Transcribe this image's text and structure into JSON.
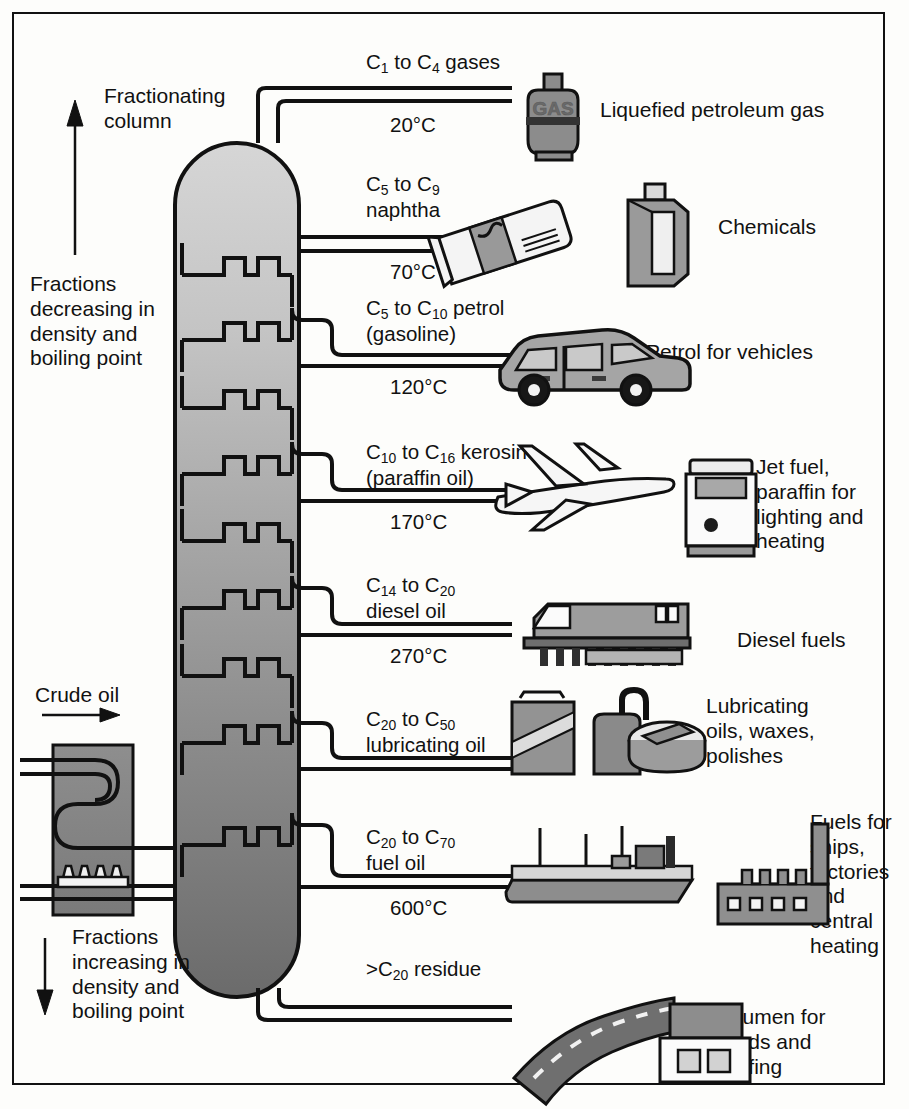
{
  "diagram": {
    "column_label": "Fractionating\ncolumn",
    "top_arrow_note": "Fractions\ndecreasing in\ndensity and\nboiling point",
    "bottom_arrow_note": "Fractions\nincreasing in\ndensity and\nboiling point",
    "feed_label": "Crude oil",
    "colors": {
      "ink": "#111111",
      "column_top": "#d2d2d2",
      "column_bottom": "#6f6f6f",
      "icon_fill": "#8c8c8c",
      "icon_light": "#c9c9c9",
      "background": "#fdfdfb"
    }
  },
  "fractions": [
    {
      "id": "gases",
      "range_html": "C<sub>1</sub> to C<sub>4</sub> gases",
      "range_text": "C1 to C4 gases",
      "temperature": "20°C",
      "use": "Liquefied petroleum gas",
      "icon": "gas-cylinder-icon"
    },
    {
      "id": "naphtha",
      "range_html": "C<sub>5</sub> to C<sub>9</sub>\nnaphtha",
      "range_text": "C5 to C9 naphtha",
      "temperature": "70°C",
      "use": "Chemicals",
      "icon": "chemicals-icon"
    },
    {
      "id": "petrol",
      "range_html": "C<sub>5</sub> to C<sub>10</sub> petrol\n(gasoline)",
      "range_text": "C5 to C10 petrol (gasoline)",
      "temperature": "120°C",
      "use": "Petrol for vehicles",
      "icon": "car-icon"
    },
    {
      "id": "kerosine",
      "range_html": "C<sub>10</sub> to C<sub>16</sub> kerosine\n(paraffin oil)",
      "range_text": "C10 to C16 kerosine (paraffin oil)",
      "temperature": "170°C",
      "use": "Jet fuel,\nparaffin for\nlighting and\nheating",
      "icon": "aeroplane-icon"
    },
    {
      "id": "diesel",
      "range_html": "C<sub>14</sub> to C<sub>20</sub>\ndiesel oil",
      "range_text": "C14 to C20 diesel oil",
      "temperature": "270°C",
      "use": "Diesel fuels",
      "icon": "train-icon"
    },
    {
      "id": "lubricating",
      "range_html": "C<sub>20</sub> to C<sub>50</sub>\nlubricating oil",
      "range_text": "C20 to C50 lubricating oil",
      "temperature": "",
      "use": "Lubricating\noils, waxes,\npolishes",
      "icon": "oil-cans-icon"
    },
    {
      "id": "fueloil",
      "range_html": "C<sub>20</sub> to C<sub>70</sub>\nfuel oil",
      "range_text": "C20 to C70 fuel oil",
      "temperature": "600°C",
      "use": "Fuels for\nships,\nfactories\nand\ncentral\nheating",
      "icon": "ship-factory-icon"
    },
    {
      "id": "residue",
      "range_html": ">C<sub>20</sub> residue",
      "range_text": ">C20 residue",
      "temperature": "",
      "use": "Bitumen for\nroads and\nroofing",
      "icon": "road-building-icon"
    }
  ],
  "chart_data": {
    "type": "diagram",
    "ylabel": "Temperature in fractionating column",
    "categories": [
      "C1 to C4 gases",
      "C5 to C9 naphtha",
      "C5 to C10 petrol (gasoline)",
      "C10 to C16 kerosine (paraffin oil)",
      "C14 to C20 diesel oil",
      "C20 to C50 lubricating oil",
      "C20 to C70 fuel oil",
      ">C20 residue"
    ],
    "temperatures_c": [
      20,
      70,
      120,
      170,
      270,
      null,
      600,
      null
    ],
    "tick_labels": [
      "20°C",
      "70°C",
      "120°C",
      "170°C",
      "270°C",
      "600°C"
    ],
    "products": [
      "Liquefied petroleum gas",
      "Chemicals",
      "Petrol for vehicles",
      "Jet fuel, paraffin for lighting and heating",
      "Diesel fuels",
      "Lubricating oils, waxes, polishes",
      "Fuels for ships, factories and central heating",
      "Bitumen for roads and roofing"
    ],
    "annotations": [
      "Fractionating column",
      "Fractions decreasing in density and boiling point",
      "Crude oil",
      "Fractions increasing in density and boiling point"
    ]
  }
}
